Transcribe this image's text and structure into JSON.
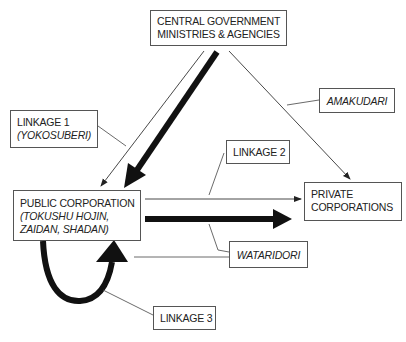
{
  "diagram": {
    "nodes": {
      "central": {
        "line1": "CENTRAL GOVERNMENT",
        "line2": "MINISTRIES & AGENCIES"
      },
      "public": {
        "line1": "PUBLIC CORPORATION",
        "line2": "(TOKUSHU HOJIN,",
        "line3": "ZAIDAN, SHADAN)"
      },
      "private": {
        "line1": "PRIVATE",
        "line2": "CORPORATIONS"
      }
    },
    "labels": {
      "linkage1": {
        "line1": "LINKAGE 1",
        "line2": "(YOKOSUBERI)"
      },
      "linkage2": "LINKAGE 2",
      "linkage3": "LINKAGE 3",
      "amakudari": "AMAKUDARI",
      "wataridori": "WATARIDORI"
    },
    "edges": [
      {
        "from": "central",
        "to": "public",
        "style": "thin",
        "label": "linkage1"
      },
      {
        "from": "central",
        "to": "public",
        "style": "thick"
      },
      {
        "from": "central",
        "to": "private",
        "style": "thin",
        "label": "amakudari"
      },
      {
        "from": "public",
        "to": "private",
        "style": "thin",
        "label": "linkage2"
      },
      {
        "from": "public",
        "to": "private",
        "style": "thick",
        "label": "wataridori"
      },
      {
        "from": "public",
        "to": "public",
        "style": "thick-loop",
        "label": "linkage3"
      }
    ],
    "colors": {
      "line": "#222222",
      "box_border": "#555555",
      "background": "#ffffff"
    }
  }
}
